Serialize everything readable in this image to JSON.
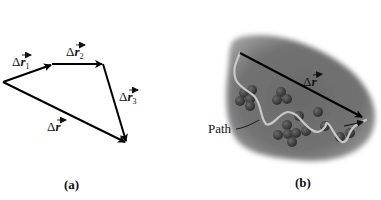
{
  "panel_a": {
    "caption": "(a)",
    "vectors": [
      {
        "name": "delta-r1",
        "delta": "Δ",
        "symbol": "r",
        "subscript": "1"
      },
      {
        "name": "delta-r2",
        "delta": "Δ",
        "symbol": "r",
        "subscript": "2"
      },
      {
        "name": "delta-r3",
        "delta": "Δ",
        "symbol": "r",
        "subscript": "3"
      },
      {
        "name": "delta-r-resultant",
        "delta": "Δ",
        "symbol": "r",
        "subscript": ""
      }
    ]
  },
  "panel_b": {
    "caption": "(b)",
    "displacement": {
      "delta": "Δ",
      "symbol": "r"
    },
    "path_label": "Path",
    "colors": {
      "region": "#6e6e6e",
      "molecules": "#3a3a3a",
      "path": "#c8c8c8"
    }
  }
}
